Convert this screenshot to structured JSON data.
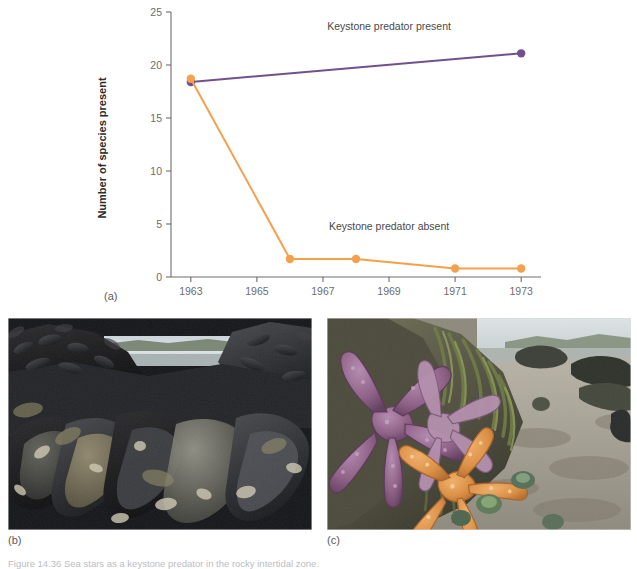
{
  "figure": {
    "caption": "Figure 14.36  Sea stars as a keystone predator in the rocky intertidal zone.",
    "panel_labels": {
      "a": "(a)",
      "b": "(b)",
      "c": "(c)"
    }
  },
  "photos": {
    "b": {
      "alt_name": "mussel-bed-photo",
      "description": "Dense bed of dark blue-black mussels covering rocky intertidal substrate, water and sky visible at the horizon"
    },
    "c": {
      "alt_name": "sea-star-photo",
      "description": "Purple and orange sea stars (Pisaster ochraceus) on an algae-covered rock with barnacles and a sandy beach behind"
    }
  },
  "chart_data": {
    "type": "line",
    "title": "",
    "xlabel": "",
    "ylabel": "Number of species present",
    "xlim": [
      1962.4,
      1973.6
    ],
    "ylim": [
      0,
      25
    ],
    "grid": false,
    "legend": "inline-annotations",
    "x_ticks": [
      1963,
      1965,
      1967,
      1969,
      1971,
      1973
    ],
    "x_tick_labels": [
      "1963",
      "1965",
      "1967",
      "1969",
      "1971",
      "1973"
    ],
    "y_ticks": [
      0,
      5,
      10,
      15,
      20,
      25
    ],
    "y_tick_labels": [
      "0",
      "5",
      "10",
      "15",
      "20",
      "25"
    ],
    "series": [
      {
        "name": "Keystone predator present",
        "color": "#71508F",
        "marker": "circle",
        "x": [
          1963,
          1973
        ],
        "values": [
          18.4,
          21.1
        ],
        "annotation": "Keystone predator present",
        "annotation_x": 1969.0,
        "annotation_y": 23.3
      },
      {
        "name": "Keystone predator absent",
        "color": "#F4A04C",
        "marker": "circle",
        "x": [
          1963,
          1966,
          1968,
          1971,
          1973
        ],
        "values": [
          18.7,
          1.7,
          1.7,
          0.8,
          0.8
        ],
        "annotation": "Keystone predator absent",
        "annotation_x": 1969.0,
        "annotation_y": 4.4
      }
    ],
    "colors": {
      "predator_present": "#71508F",
      "predator_absent": "#F4A04C",
      "axis": "#6d6d6d",
      "tick_label": "#6d6d6d",
      "axis_title": "#2b2b2b"
    }
  }
}
